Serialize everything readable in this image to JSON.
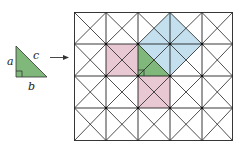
{
  "labels": {
    "a": "a",
    "b": "b",
    "c": "c"
  },
  "colors": {
    "triangle": "#7fb87a",
    "square_c": "#c4e0ee",
    "square_ab": "#e8c8d2",
    "grid": "#222222"
  },
  "grid": {
    "columns": 5,
    "rows": 4,
    "diagonals": true
  }
}
